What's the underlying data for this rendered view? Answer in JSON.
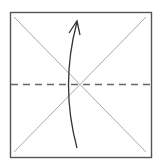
{
  "diagram": {
    "type": "origami-fold-step",
    "paper": {
      "x": 10,
      "y": 12,
      "width": 141,
      "height": 145,
      "stroke": "#555555"
    },
    "creases": [
      {
        "name": "diagonal-tl-br",
        "x1": 14,
        "y1": 17,
        "x2": 146,
        "y2": 152,
        "stroke": "#aaaaaa"
      },
      {
        "name": "diagonal-tr-bl",
        "x1": 146,
        "y1": 17,
        "x2": 14,
        "y2": 152,
        "stroke": "#aaaaaa"
      }
    ],
    "fold_line": {
      "style": "dashed",
      "x1": 10,
      "y1": 84,
      "x2": 151,
      "y2": 84,
      "stroke": "#666666"
    },
    "arrow": {
      "direction": "up",
      "start": [
        77,
        148
      ],
      "control": [
        60,
        85
      ],
      "end": [
        77,
        22
      ],
      "stroke": "#333333"
    }
  }
}
